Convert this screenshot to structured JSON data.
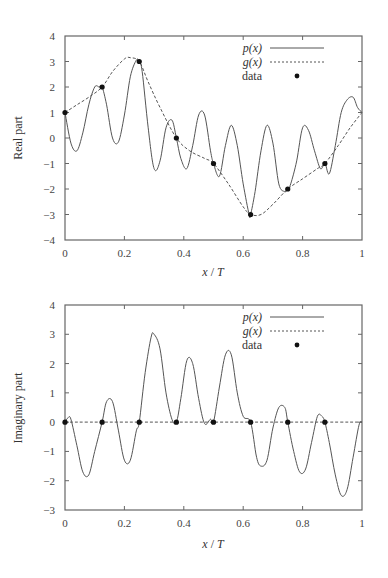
{
  "chart_data": [
    {
      "type": "line",
      "title": "",
      "xlabel": "x/T",
      "ylabel": "Real part",
      "xlim": [
        0,
        1
      ],
      "ylim": [
        -4,
        4
      ],
      "xticks": [
        "0",
        "0.2",
        "0.4",
        "0.6",
        "0.8",
        "1"
      ],
      "yticks": [
        "-4",
        "-3",
        "-2",
        "-1",
        "0",
        "1",
        "2",
        "3",
        "4"
      ],
      "grid": false,
      "legend_position": "upper right",
      "legend": [
        "p(x)",
        "g(x)",
        "data"
      ],
      "series": [
        {
          "name": "p(x)",
          "style": "solid",
          "x": [
            0,
            0.02,
            0.04,
            0.06,
            0.08,
            0.1,
            0.115,
            0.125,
            0.14,
            0.16,
            0.18,
            0.2,
            0.22,
            0.24,
            0.25,
            0.26,
            0.28,
            0.3,
            0.32,
            0.34,
            0.36,
            0.375,
            0.39,
            0.41,
            0.43,
            0.45,
            0.47,
            0.49,
            0.5,
            0.52,
            0.54,
            0.56,
            0.58,
            0.6,
            0.62,
            0.625,
            0.64,
            0.66,
            0.68,
            0.7,
            0.72,
            0.74,
            0.75,
            0.76,
            0.78,
            0.8,
            0.82,
            0.84,
            0.86,
            0.875,
            0.89,
            0.91,
            0.93,
            0.95,
            0.97,
            0.985,
            1
          ],
          "values": [
            1,
            -0.2,
            -0.5,
            0.2,
            1.3,
            2.0,
            2.0,
            2.0,
            1.3,
            0.0,
            -0.15,
            0.9,
            2.4,
            3.05,
            3.0,
            2.6,
            0.4,
            -1.2,
            -0.9,
            0.4,
            0.7,
            0.0,
            -0.8,
            -1.2,
            -0.3,
            0.9,
            0.9,
            -0.5,
            -1.0,
            -1.5,
            -0.3,
            0.5,
            -0.3,
            -1.8,
            -3.0,
            -3.0,
            -2.1,
            -0.5,
            0.5,
            -0.2,
            -1.8,
            -2.1,
            -2.0,
            -1.8,
            -0.9,
            0.4,
            0.3,
            -0.5,
            -1.2,
            -1.0,
            -1.4,
            -0.3,
            1.0,
            1.5,
            1.6,
            1.2,
            1.0
          ]
        },
        {
          "name": "g(x)",
          "style": "dashed",
          "x": [
            0,
            0.04,
            0.08,
            0.125,
            0.16,
            0.2,
            0.22,
            0.25,
            0.28,
            0.32,
            0.375,
            0.42,
            0.47,
            0.5,
            0.55,
            0.6,
            0.625,
            0.66,
            0.7,
            0.75,
            0.8,
            0.85,
            0.875,
            0.92,
            0.96,
            1
          ],
          "values": [
            1,
            1.3,
            1.6,
            2.0,
            2.6,
            3.1,
            3.15,
            3.0,
            2.2,
            1.2,
            0.0,
            -0.5,
            -0.8,
            -1.0,
            -1.8,
            -2.7,
            -3.0,
            -3.0,
            -2.6,
            -2.0,
            -1.6,
            -1.2,
            -1.0,
            -0.3,
            0.4,
            1.0
          ]
        },
        {
          "name": "data",
          "style": "markers",
          "x": [
            0,
            0.125,
            0.25,
            0.375,
            0.5,
            0.625,
            0.75,
            0.875
          ],
          "values": [
            1,
            2,
            3,
            0,
            -1,
            -3,
            -2,
            -1
          ]
        }
      ]
    },
    {
      "type": "line",
      "title": "",
      "xlabel": "x/T",
      "ylabel": "Imaginary part",
      "xlim": [
        0,
        1
      ],
      "ylim": [
        -3,
        4
      ],
      "xticks": [
        "0",
        "0.2",
        "0.4",
        "0.6",
        "0.8",
        "1"
      ],
      "yticks": [
        "-3",
        "-2",
        "-1",
        "0",
        "1",
        "2",
        "3",
        "4"
      ],
      "grid": false,
      "legend_position": "upper right",
      "legend": [
        "p(x)",
        "g(x)",
        "data"
      ],
      "series": [
        {
          "name": "p(x)",
          "style": "solid",
          "x": [
            0,
            0.01,
            0.02,
            0.04,
            0.06,
            0.08,
            0.1,
            0.125,
            0.14,
            0.16,
            0.18,
            0.2,
            0.22,
            0.24,
            0.25,
            0.27,
            0.29,
            0.3,
            0.32,
            0.34,
            0.36,
            0.375,
            0.39,
            0.41,
            0.43,
            0.45,
            0.47,
            0.49,
            0.5,
            0.52,
            0.54,
            0.56,
            0.58,
            0.6,
            0.625,
            0.645,
            0.66,
            0.68,
            0.7,
            0.72,
            0.74,
            0.75,
            0.77,
            0.79,
            0.81,
            0.83,
            0.85,
            0.865,
            0.875,
            0.89,
            0.91,
            0.93,
            0.95,
            0.97,
            0.99,
            1
          ],
          "values": [
            0,
            0.15,
            0.1,
            -0.8,
            -1.7,
            -1.8,
            -1.0,
            0.0,
            0.7,
            0.7,
            -0.3,
            -1.3,
            -1.3,
            -0.3,
            0.0,
            1.7,
            2.9,
            3.0,
            2.5,
            1.0,
            0.1,
            0.0,
            0.8,
            2.1,
            2.0,
            0.8,
            -0.05,
            0.1,
            0.0,
            1.2,
            2.3,
            2.3,
            1.0,
            0.2,
            0.0,
            -1.2,
            -1.5,
            -1.3,
            -0.2,
            0.5,
            0.5,
            0.0,
            -1.0,
            -1.7,
            -1.6,
            -0.7,
            0.2,
            0.2,
            0.0,
            -0.7,
            -1.8,
            -2.5,
            -2.3,
            -1.2,
            -0.1,
            0.0
          ]
        },
        {
          "name": "g(x)",
          "style": "dashed",
          "x": [
            0,
            1
          ],
          "values": [
            0,
            0
          ]
        },
        {
          "name": "data",
          "style": "markers",
          "x": [
            0,
            0.125,
            0.25,
            0.375,
            0.5,
            0.625,
            0.75,
            0.875
          ],
          "values": [
            0,
            0,
            0,
            0,
            0,
            0,
            0,
            0
          ]
        }
      ]
    }
  ],
  "plots": [
    {
      "ylabel": "Real part",
      "xlabel_var": "x",
      "xlabel_sep": " / ",
      "xlabel_T": "T",
      "legend": [
        {
          "label": "p(x)",
          "style": "solid"
        },
        {
          "label": "g(x)",
          "style": "dashed"
        },
        {
          "label": "data",
          "style": "marker"
        }
      ]
    },
    {
      "ylabel": "Imaginary part",
      "xlabel_var": "x",
      "xlabel_sep": " / ",
      "xlabel_T": "T",
      "legend": [
        {
          "label": "p(x)",
          "style": "solid"
        },
        {
          "label": "g(x)",
          "style": "dashed"
        },
        {
          "label": "data",
          "style": "marker"
        }
      ]
    }
  ],
  "colors": {
    "line": "#555555",
    "axis": "#666666",
    "marker": "#111111",
    "text": "#333333"
  }
}
